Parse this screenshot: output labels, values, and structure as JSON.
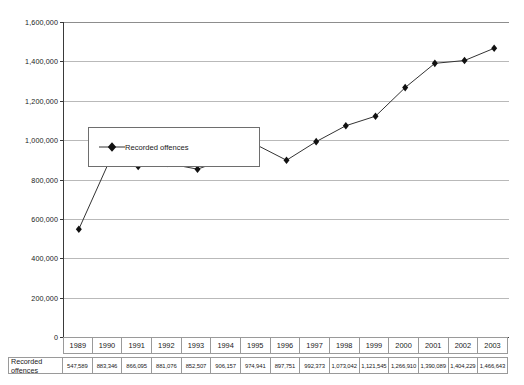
{
  "chart_data": {
    "type": "line",
    "title": "",
    "xlabel": "",
    "ylabel": "",
    "ylim": [
      0,
      1600000
    ],
    "ytick_step": 200000,
    "grid": true,
    "legend_position": "inside-upper-left",
    "marker": "filled-diamond",
    "line_color": "#333333",
    "marker_color": "#111111",
    "categories": [
      "1989",
      "1990",
      "1991",
      "1992",
      "1993",
      "1994",
      "1995",
      "1996",
      "1997",
      "1998",
      "1999",
      "2000",
      "2001",
      "2002",
      "2003"
    ],
    "series": [
      {
        "name": "Recorded offences",
        "values": [
          547589,
          883346,
          866095,
          881076,
          852507,
          906157,
          974941,
          897751,
          992373,
          1073042,
          1121545,
          1266910,
          1390089,
          1404229,
          1466643
        ],
        "value_labels": [
          "547,589",
          "883,346",
          "866,095",
          "881,076",
          "852,507",
          "906,157",
          "974,941",
          "897,751",
          "992,373",
          "1,073,042",
          "1,121,545",
          "1,266,910",
          "1,390,089",
          "1,404,229",
          "1,466,643"
        ]
      }
    ],
    "ytick_labels": [
      "0",
      "200,000",
      "400,000",
      "600,000",
      "800,000",
      "1,000,000",
      "1,200,000",
      "1,400,000",
      "1,600,000"
    ],
    "ytick_values": [
      0,
      200000,
      400000,
      600000,
      800000,
      1000000,
      1200000,
      1400000,
      1600000
    ]
  },
  "legend": {
    "entries": [
      {
        "label": "Recorded offences",
        "marker": "filled-diamond"
      }
    ]
  },
  "table": {
    "row_label": "Recorded offences",
    "header": [
      "1989",
      "1990",
      "1991",
      "1992",
      "1993",
      "1994",
      "1995",
      "1996",
      "1997",
      "1998",
      "1999",
      "2000",
      "2001",
      "2002",
      "2003"
    ],
    "values": [
      "547,589",
      "883,346",
      "866,095",
      "881,076",
      "852,507",
      "906,157",
      "974,941",
      "897,751",
      "992,373",
      "1,073,042",
      "1,121,545",
      "1,266,910",
      "1,390,089",
      "1,404,229",
      "1,466,643"
    ]
  }
}
